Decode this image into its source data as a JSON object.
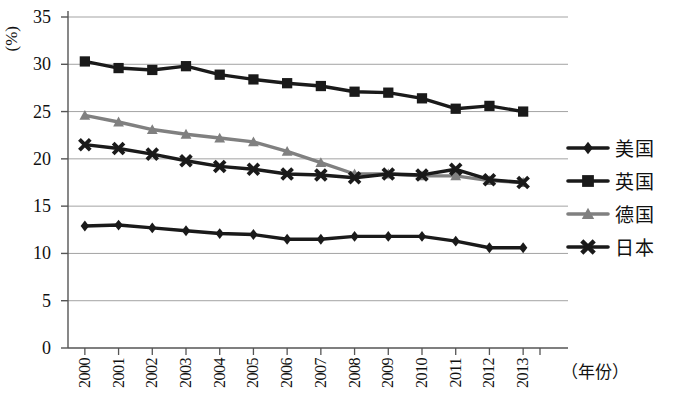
{
  "chart_data": {
    "type": "line",
    "title": "",
    "xlabel": "（年份）",
    "ylabel": "(%)",
    "categories": [
      "2000",
      "2001",
      "2002",
      "2003",
      "2004",
      "2005",
      "2006",
      "2007",
      "2008",
      "2009",
      "2010",
      "2011",
      "2012",
      "2013"
    ],
    "x": [
      2000,
      2001,
      2002,
      2003,
      2004,
      2005,
      2006,
      2007,
      2008,
      2009,
      2010,
      2011,
      2012,
      2013
    ],
    "ylim": [
      0,
      35
    ],
    "yticks": [
      0,
      5,
      10,
      15,
      20,
      25,
      30,
      35
    ],
    "grid": true,
    "legend_position": "right",
    "series": [
      {
        "name": "美国",
        "marker": "diamond",
        "color": "#1a1a1a",
        "values": [
          12.9,
          13.0,
          12.7,
          12.4,
          12.1,
          12.0,
          11.5,
          11.5,
          11.8,
          11.8,
          11.8,
          11.3,
          10.6,
          10.6
        ]
      },
      {
        "name": "英国",
        "marker": "square",
        "color": "#1a1a1a",
        "values": [
          30.3,
          29.6,
          29.4,
          29.8,
          28.9,
          28.4,
          28.0,
          27.7,
          27.1,
          27.0,
          26.4,
          25.3,
          25.6,
          25.0
        ]
      },
      {
        "name": "德国",
        "marker": "triangle",
        "color": "#808080",
        "values": [
          24.6,
          23.9,
          23.1,
          22.6,
          22.2,
          21.8,
          20.8,
          19.6,
          18.4,
          18.4,
          18.2,
          18.2,
          17.7,
          17.5
        ]
      },
      {
        "name": "日本",
        "marker": "cross",
        "color": "#1a1a1a",
        "values": [
          21.5,
          21.1,
          20.5,
          19.8,
          19.2,
          18.9,
          18.4,
          18.3,
          18.0,
          18.4,
          18.3,
          18.9,
          17.8,
          17.5
        ]
      }
    ]
  },
  "legend": {
    "items": [
      {
        "label": "美国"
      },
      {
        "label": "英国"
      },
      {
        "label": "德国"
      },
      {
        "label": "日本"
      }
    ]
  },
  "axes": {
    "y_unit_label": "(%)",
    "x_unit_label": "（年份）",
    "y_tick_labels": [
      "35",
      "30",
      "25",
      "20",
      "15",
      "10",
      "5",
      "0"
    ],
    "x_tick_labels": [
      "2000",
      "2001",
      "2002",
      "2003",
      "2004",
      "2005",
      "2006",
      "2007",
      "2008",
      "2009",
      "2010",
      "2011",
      "2012",
      "2013"
    ]
  },
  "style": {
    "axis_color": "#555555",
    "grid_color": "#999999",
    "dark_series_color": "#1a1a1a",
    "gray_series_color": "#808080",
    "background": "#ffffff"
  }
}
